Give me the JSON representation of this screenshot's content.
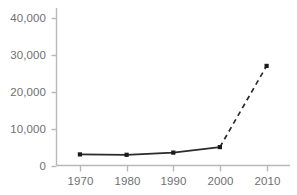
{
  "chart_data": {
    "type": "line",
    "title": "",
    "subtitle": "",
    "xlabel": "",
    "ylabel": "",
    "categories": [
      "1970",
      "1980",
      "1990",
      "2000",
      "2010"
    ],
    "x": [
      1970,
      1980,
      1990,
      2000,
      2010
    ],
    "values": [
      3000,
      2900,
      3500,
      5000,
      27000
    ],
    "series": [
      {
        "name": "",
        "values": [
          3000,
          2900,
          3500,
          5000,
          27000
        ],
        "segments": [
          {
            "style": "solid",
            "from_index": 0,
            "to_index": 3
          },
          {
            "style": "dashed",
            "from_index": 3,
            "to_index": 4
          }
        ]
      }
    ],
    "xlim": [
      1965,
      2015
    ],
    "ylim": [
      0,
      43000
    ],
    "yticks": [
      0,
      10000,
      20000,
      30000,
      40000
    ],
    "ytick_labels": [
      "0",
      "10,000",
      "20,000",
      "30,000",
      "40,000"
    ],
    "xticks": [
      1970,
      1980,
      1990,
      2000,
      2010
    ],
    "xtick_labels": [
      "1970",
      "1980",
      "1990",
      "2000",
      "2010"
    ],
    "grid": false,
    "legend": false,
    "legend_position": "none",
    "marker": "square",
    "colors": {
      "line": "#2b2b2b",
      "marker": "#1a1a1a",
      "axis": "#b8b8b8",
      "tick": "#b8b8b8",
      "tick_label": "#6f6f6f",
      "background": "#ffffff"
    }
  }
}
